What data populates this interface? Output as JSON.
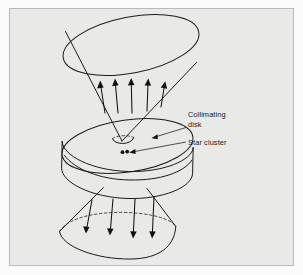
{
  "figure": {
    "background_color": "#fbfbfb",
    "panel_color": "#e9e9e7",
    "panel_border_color": "#b9b9b6",
    "ink_color": "#1a1a1a",
    "panel": {
      "x": 9,
      "y": 8,
      "width": 285,
      "height": 258
    }
  },
  "labels": {
    "collimating_disk": {
      "line1": "Collimating",
      "line2": "disk",
      "x": 188,
      "y": 117
    },
    "star_cluster": {
      "text": "Star cluster",
      "x": 188,
      "y": 144
    }
  },
  "parts": {
    "upper_cone": {
      "name": "upper light cone",
      "rim_ellipse": {
        "cx": 131,
        "cy": 45,
        "rx": 69,
        "ry": 28,
        "rotation": -11
      },
      "apex": {
        "x": 122,
        "y": 141
      },
      "arrow_count": 5
    },
    "disk": {
      "name": "collimating disk",
      "top_ellipse": {
        "cx": 127,
        "cy": 146,
        "rx": 66,
        "ry": 26,
        "rotation": -8
      },
      "thickness": 32,
      "aperture": {
        "cx": 123,
        "cy": 139,
        "rx": 11,
        "ry": 5
      }
    },
    "star_cluster": {
      "name": "star cluster dots",
      "dots": [
        {
          "x": 122.5,
          "y": 152.2,
          "r": 1.9
        },
        {
          "x": 127.2,
          "y": 151.6,
          "r": 1.9
        }
      ]
    },
    "lower_cone": {
      "name": "lower light cone",
      "base_ellipse": {
        "cx": 117,
        "cy": 239,
        "rx": 59,
        "ry": 21,
        "rotation": -4
      },
      "apex": {
        "x": 124,
        "y": 186
      },
      "arrow_count": 4,
      "hidden_back_edge": "dashed"
    }
  },
  "arrows": {
    "upper": [
      {
        "x1": 105,
        "y1": 113,
        "x2": 100,
        "y2": 83
      },
      {
        "x1": 118,
        "y1": 113,
        "x2": 115,
        "y2": 80
      },
      {
        "x1": 132,
        "y1": 113,
        "x2": 131,
        "y2": 79
      },
      {
        "x1": 147,
        "y1": 111,
        "x2": 148,
        "y2": 80
      },
      {
        "x1": 161,
        "y1": 107,
        "x2": 165,
        "y2": 83
      }
    ],
    "lower": [
      {
        "x1": 92,
        "y1": 200,
        "x2": 86,
        "y2": 231
      },
      {
        "x1": 113,
        "y1": 199,
        "x2": 110,
        "y2": 233
      },
      {
        "x1": 135,
        "y1": 199,
        "x2": 133,
        "y2": 236
      },
      {
        "x1": 154,
        "y1": 197,
        "x2": 152,
        "y2": 236
      }
    ]
  },
  "leaders": {
    "collimating_disk": {
      "x1": 186,
      "y1": 127,
      "x2": 154,
      "y2": 137
    },
    "star_cluster": {
      "x1": 186,
      "y1": 142,
      "x2": 130,
      "y2": 152
    }
  }
}
